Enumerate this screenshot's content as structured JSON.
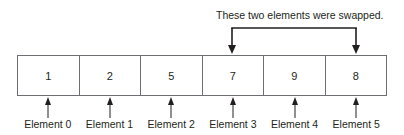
{
  "annotation": {
    "caption": "These two elements were swapped.",
    "swapped_indices": [
      3,
      5
    ]
  },
  "array": {
    "cells": [
      {
        "value": "1",
        "label": "Element 0"
      },
      {
        "value": "2",
        "label": "Element 1"
      },
      {
        "value": "5",
        "label": "Element 2"
      },
      {
        "value": "7",
        "label": "Element 3"
      },
      {
        "value": "9",
        "label": "Element 4"
      },
      {
        "value": "8",
        "label": "Element 5"
      }
    ]
  },
  "colors": {
    "line": "#231f20",
    "border": "#6d6e71",
    "text": "#231f20",
    "background": "#ffffff"
  }
}
